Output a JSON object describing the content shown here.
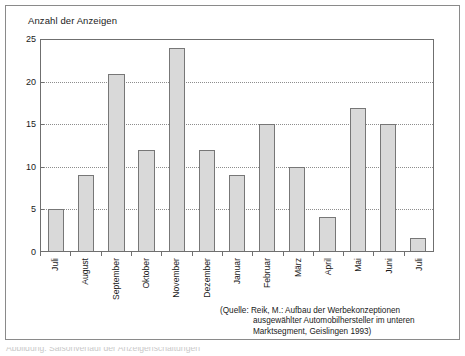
{
  "figure": {
    "title": "Anzahl der Anzeigen",
    "source_line_1": "(Quelle: Reik, M.: Aufbau der Werbekonzeptionen",
    "source_line_2": "ausgewählter Automobilhersteller im unteren",
    "source_line_3": "Marktsegment, Geislingen 1993)",
    "bottom_caption": "Abbildung: Saisonverlauf der Anzeigenschaltungen"
  },
  "colors": {
    "bar_fill": "#d9d9d9",
    "bar_border": "#777777",
    "grid": "#8d8d8d",
    "axis": "#6f6f6f",
    "frame": "#8a8a8a",
    "text": "#1a1a1a"
  },
  "chart_data": {
    "type": "bar",
    "title": "Anzahl der Anzeigen",
    "xlabel": "",
    "ylabel": "Anzahl der Anzeigen",
    "ylim": [
      0,
      25
    ],
    "yticks": [
      0,
      5,
      10,
      15,
      20,
      25
    ],
    "gridlines": [
      5,
      10,
      15,
      20
    ],
    "grid": true,
    "legend": false,
    "categories": [
      "Juli",
      "August",
      "September",
      "Oktober",
      "November",
      "Dezember",
      "Januar",
      "Februar",
      "März",
      "April",
      "Mai",
      "Juni",
      "Juli"
    ],
    "values": [
      5,
      9,
      21,
      12,
      24,
      12,
      9,
      15,
      10,
      4,
      17,
      15,
      1.5
    ],
    "annotations": [
      "(Quelle: Reik, M.: Aufbau der Werbekonzeptionen ausgewählter Automobilhersteller im unteren Marktsegment, Geislingen 1993)"
    ]
  }
}
